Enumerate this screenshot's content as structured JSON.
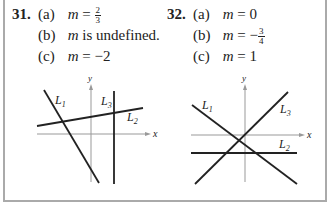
{
  "problems": [
    {
      "number": "31.",
      "parts": [
        {
          "label": "(a)",
          "var": "m",
          "eq": "=",
          "value": "",
          "frac_num": "2",
          "frac_den": "3",
          "text": ""
        },
        {
          "label": "(b)",
          "var": "m",
          "eq": "",
          "value": "",
          "text": "is undefined."
        },
        {
          "label": "(c)",
          "var": "m",
          "eq": "=",
          "value": "−2",
          "text": ""
        }
      ],
      "graph": {
        "x_axis_label": "x",
        "y_axis_label": "y",
        "lines": [
          {
            "name": "L",
            "sub": "1",
            "description": "steep negative slope"
          },
          {
            "name": "L",
            "sub": "2",
            "description": "shallow positive slope"
          },
          {
            "name": "L",
            "sub": "3",
            "description": "vertical line"
          }
        ]
      }
    },
    {
      "number": "32.",
      "parts": [
        {
          "label": "(a)",
          "var": "m",
          "eq": "=",
          "value": "0",
          "text": ""
        },
        {
          "label": "(b)",
          "var": "m",
          "eq": "=",
          "value": "−",
          "frac_num": "3",
          "frac_den": "4",
          "text": ""
        },
        {
          "label": "(c)",
          "var": "m",
          "eq": "=",
          "value": "1",
          "text": ""
        }
      ],
      "graph": {
        "x_axis_label": "x",
        "y_axis_label": "y",
        "lines": [
          {
            "name": "L",
            "sub": "1",
            "description": "negative slope"
          },
          {
            "name": "L",
            "sub": "2",
            "description": "horizontal line"
          },
          {
            "name": "L",
            "sub": "3",
            "description": "positive slope"
          }
        ]
      }
    }
  ]
}
